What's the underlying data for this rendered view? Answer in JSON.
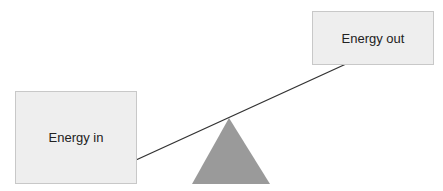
{
  "diagram": {
    "boxes": [
      {
        "id": "energy-in",
        "label": "Energy in"
      },
      {
        "id": "energy-out",
        "label": "Energy out"
      }
    ],
    "colors": {
      "box_fill": "#eeeeee",
      "box_border": "#c8c8c8",
      "fulcrum": "#9a9a9a",
      "beam": "#333333"
    }
  }
}
